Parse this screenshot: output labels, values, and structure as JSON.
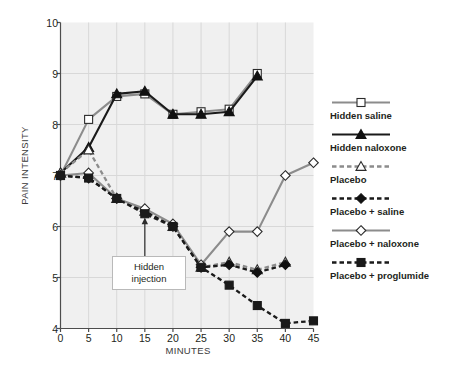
{
  "chart_data": {
    "type": "line",
    "title": "",
    "xlabel": "MINUTES",
    "ylabel": "PAIN INTENSITY",
    "xlim": [
      0,
      45
    ],
    "ylim": [
      4,
      10
    ],
    "xticks": [
      0,
      5,
      10,
      15,
      20,
      25,
      30,
      35,
      40,
      45
    ],
    "yticks": [
      4,
      5,
      6,
      7,
      8,
      9,
      10
    ],
    "grid": true,
    "legend_position": "right",
    "x": [
      0,
      5,
      10,
      15,
      20,
      25,
      30,
      35,
      40,
      45
    ],
    "series": [
      {
        "name": "Hidden saline",
        "marker": "square-open",
        "line": "solid",
        "color": "#8c8c8c",
        "values": [
          7.0,
          8.1,
          8.55,
          8.6,
          8.2,
          8.25,
          8.3,
          9.0,
          null,
          null
        ]
      },
      {
        "name": "Hidden naloxone",
        "marker": "triangle-filled",
        "line": "solid",
        "color": "#1a1a1a",
        "values": [
          7.05,
          7.55,
          8.6,
          8.65,
          8.2,
          8.2,
          8.25,
          8.95,
          null,
          null
        ]
      },
      {
        "name": "Placebo",
        "marker": "triangle-open",
        "line": "dashed",
        "color": "#8c8c8c",
        "values": [
          7.05,
          7.5,
          6.55,
          6.3,
          6.0,
          5.2,
          5.3,
          5.15,
          5.3,
          null
        ]
      },
      {
        "name": "Placebo + saline",
        "marker": "diamond-filled",
        "line": "dashed",
        "color": "#1a1a1a",
        "values": [
          7.0,
          6.95,
          6.55,
          6.3,
          6.0,
          5.2,
          5.25,
          5.1,
          5.25,
          null
        ]
      },
      {
        "name": "Placebo + naloxone",
        "marker": "diamond-open",
        "line": "solid",
        "color": "#8c8c8c",
        "values": [
          7.0,
          7.05,
          6.55,
          6.35,
          6.05,
          5.25,
          5.9,
          5.9,
          7.0,
          7.25
        ]
      },
      {
        "name": "Placebo + proglumide",
        "marker": "square-filled",
        "line": "dashed",
        "color": "#1a1a1a",
        "values": [
          7.0,
          6.95,
          6.55,
          6.25,
          6.0,
          5.2,
          4.85,
          4.45,
          4.1,
          4.15
        ]
      }
    ],
    "annotations": [
      {
        "text": "Hidden injection",
        "line1": "Hidden",
        "line2": "injection",
        "x": 15,
        "points_to_y": 6.25
      }
    ]
  },
  "axis": {
    "ylabel": "PAIN INTENSITY",
    "xlabel": "MINUTES",
    "ytick_labels": [
      "10",
      "9",
      "8",
      "7",
      "6",
      "5",
      "4"
    ],
    "xtick_labels": [
      "0",
      "5",
      "10",
      "15",
      "20",
      "25",
      "30",
      "35",
      "40",
      "45"
    ]
  },
  "legend": {
    "items": [
      {
        "label": "Hidden saline"
      },
      {
        "label": "Hidden naloxone"
      },
      {
        "label": "Placebo"
      },
      {
        "label": "Placebo + saline"
      },
      {
        "label": "Placebo + naloxone"
      },
      {
        "label": "Placebo + proglumide"
      }
    ]
  },
  "annotation": {
    "line1": "Hidden",
    "line2": "injection"
  },
  "colors": {
    "gray_series": "#8c8c8c",
    "black_series": "#1a1a1a",
    "plot_background": "#f0f0f0",
    "gridline": "#d8d8d8",
    "axis": "#4d4d4d"
  }
}
